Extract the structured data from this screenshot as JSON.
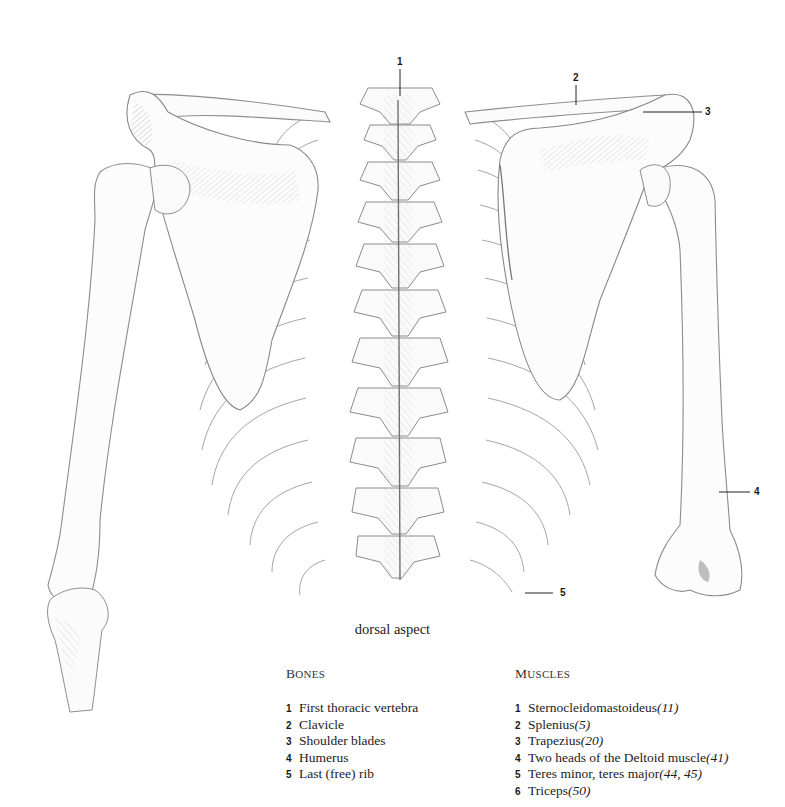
{
  "figure": {
    "view": "dorsal aspect",
    "callouts": [
      {
        "num": "1",
        "x": 397,
        "y": 57,
        "line": {
          "x1": 400,
          "y1": 69,
          "x2": 400,
          "y2": 96
        }
      },
      {
        "num": "2",
        "x": 573,
        "y": 73,
        "line": {
          "x1": 576,
          "y1": 85,
          "x2": 576,
          "y2": 105
        }
      },
      {
        "num": "3",
        "x": 705,
        "y": 107,
        "line": {
          "x1": 643,
          "y1": 112,
          "x2": 702,
          "y2": 112
        }
      },
      {
        "num": "4",
        "x": 754,
        "y": 487,
        "line": {
          "x1": 719,
          "y1": 492,
          "x2": 750,
          "y2": 492
        }
      },
      {
        "num": "5",
        "x": 560,
        "y": 588,
        "line": {
          "x1": 525,
          "y1": 593,
          "x2": 553,
          "y2": 593
        }
      }
    ]
  },
  "bones": {
    "title_cap": "B",
    "title_rest": "ONES",
    "items": [
      {
        "num": "1",
        "label": "First thoracic vertebra"
      },
      {
        "num": "2",
        "label": "Clavicle"
      },
      {
        "num": "3",
        "label": "Shoulder blades"
      },
      {
        "num": "4",
        "label": "Humerus"
      },
      {
        "num": "5",
        "label": "Last (free) rib"
      }
    ]
  },
  "muscles": {
    "title_cap": "M",
    "title_rest": "USCLES",
    "items": [
      {
        "num": "1",
        "label": "Sternocleidomastoideus ",
        "ref": "(11)"
      },
      {
        "num": "2",
        "label": "Splenius ",
        "ref": "(5)"
      },
      {
        "num": "3",
        "label": "Trapezius ",
        "ref": "(20)"
      },
      {
        "num": "4",
        "label": "Two heads of the Deltoid muscle ",
        "ref": "(41)"
      },
      {
        "num": "5",
        "label": "Teres minor, teres major ",
        "ref": "(44, 45)"
      },
      {
        "num": "6",
        "label": "Triceps ",
        "ref": "(50)"
      }
    ]
  },
  "colors": {
    "line": "#8a8a8a",
    "shade": "#b5b5b5",
    "dark": "#555555",
    "background": "#ffffff"
  }
}
